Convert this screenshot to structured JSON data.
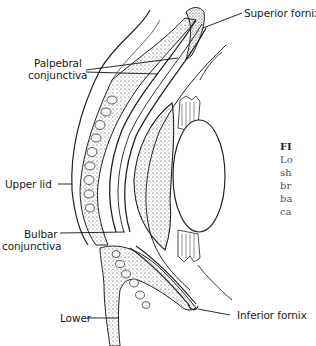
{
  "diagram": {
    "labels": {
      "superior_fornix": "Superior fornix",
      "palpebral_line1": "Palpebral",
      "palpebral_line2": "conjunctiva",
      "upper_lid": "Upper lid",
      "bulbar_line1": "Bulbar",
      "bulbar_line2": "conjunctiva",
      "lower": "Lower",
      "inferior_fornix": "Inferior fornix"
    }
  },
  "caption": {
    "fig_prefix": "FI",
    "lines": [
      "Lo",
      "sh",
      "br",
      "ba",
      "ca"
    ]
  }
}
